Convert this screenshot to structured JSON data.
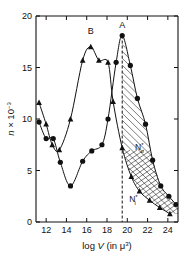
{
  "chart_data": {
    "type": "line",
    "title": "",
    "xlabel": "log V (in μ³)",
    "xlabel_parts": {
      "prefix": "log ",
      "symbol": "V",
      "suffix": " (in μ",
      "exponent": "3",
      "close": ")"
    },
    "ylabel": "n × 10⁻³",
    "ylabel_parts": {
      "variable": "n",
      "times": " × 10",
      "exponent": "− 3"
    },
    "xlim": [
      11.0,
      25.0
    ],
    "ylim": [
      0,
      20
    ],
    "xticks": [
      12,
      14,
      16,
      18,
      20,
      22,
      24
    ],
    "yticks": [
      0,
      5,
      10,
      15,
      20
    ],
    "grid": false,
    "legend_position": "inline-annotations",
    "annotations": [
      {
        "name": "peak-A",
        "text": "A",
        "x": 19.5,
        "y": 18.8
      },
      {
        "name": "peak-B",
        "text": "B",
        "x": 16.4,
        "y": 18.3
      },
      {
        "name": "region-upper",
        "text": "N",
        "sub": "o",
        "sup": "*",
        "x": 21.2,
        "y": 7.0
      },
      {
        "name": "region-lower",
        "text": "N",
        "sub": "i",
        "sup": "*",
        "x": 20.6,
        "y": 1.9
      }
    ],
    "divider": {
      "name": "threshold-line",
      "x": 19.5,
      "style": "dashed",
      "y_from": 0,
      "y_to": 18.1
    },
    "hatched_region": {
      "name": "shaded-region",
      "description": "diagonally hatched area between curve A and curve B to the right of the dashed threshold",
      "x_start": 19.5,
      "x_end": 25.0
    },
    "series": [
      {
        "name": "A",
        "marker": "circle",
        "points": [
          {
            "x": 11.3,
            "y": 9.7
          },
          {
            "x": 12.0,
            "y": 8.1
          },
          {
            "x": 12.7,
            "y": 8.1
          },
          {
            "x": 13.4,
            "y": 5.8
          },
          {
            "x": 14.4,
            "y": 3.5
          },
          {
            "x": 15.6,
            "y": 5.9
          },
          {
            "x": 16.5,
            "y": 6.9
          },
          {
            "x": 17.5,
            "y": 7.5
          },
          {
            "x": 18.1,
            "y": 10.0
          },
          {
            "x": 18.9,
            "y": 15.5
          },
          {
            "x": 19.5,
            "y": 18.1
          },
          {
            "x": 20.3,
            "y": 15.2
          },
          {
            "x": 21.0,
            "y": 12.0
          },
          {
            "x": 21.8,
            "y": 9.5
          },
          {
            "x": 22.5,
            "y": 6.0
          },
          {
            "x": 23.3,
            "y": 3.5
          },
          {
            "x": 24.1,
            "y": 2.5
          },
          {
            "x": 24.8,
            "y": 1.7
          }
        ]
      },
      {
        "name": "B",
        "marker": "triangle",
        "points": [
          {
            "x": 11.3,
            "y": 11.6
          },
          {
            "x": 12.0,
            "y": 9.5
          },
          {
            "x": 12.6,
            "y": 7.5
          },
          {
            "x": 13.3,
            "y": 7.0
          },
          {
            "x": 14.4,
            "y": 10.0
          },
          {
            "x": 15.6,
            "y": 15.7
          },
          {
            "x": 16.4,
            "y": 17.0
          },
          {
            "x": 17.2,
            "y": 15.7
          },
          {
            "x": 18.1,
            "y": 15.5
          },
          {
            "x": 18.6,
            "y": 11.7
          },
          {
            "x": 19.5,
            "y": 7.2
          },
          {
            "x": 20.4,
            "y": 4.4
          },
          {
            "x": 21.2,
            "y": 3.0
          },
          {
            "x": 22.2,
            "y": 2.1
          },
          {
            "x": 23.2,
            "y": 1.4
          },
          {
            "x": 24.2,
            "y": 0.8
          }
        ]
      }
    ],
    "colors": {
      "axis": "#111111",
      "curve": "#111111",
      "marker": "#111111",
      "background": "#ffffff"
    }
  }
}
